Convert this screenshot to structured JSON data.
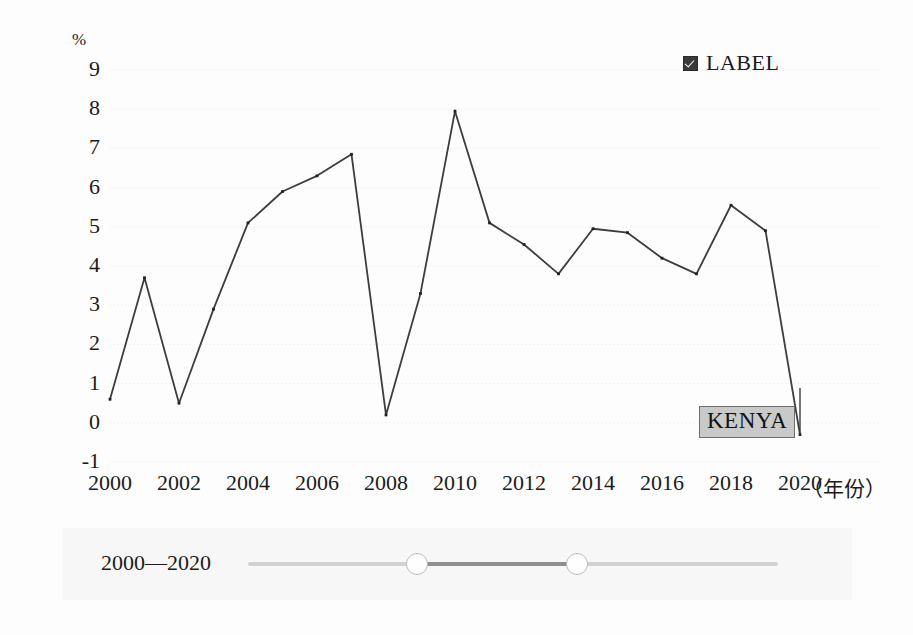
{
  "chart_data": {
    "type": "line",
    "title": "",
    "subtitle": "",
    "xlabel": "（年份）",
    "ylabel": "%",
    "unit_label": "%",
    "x": [
      2000,
      2001,
      2002,
      2003,
      2004,
      2005,
      2006,
      2007,
      2008,
      2009,
      2010,
      2011,
      2012,
      2013,
      2014,
      2015,
      2016,
      2017,
      2018,
      2019,
      2020
    ],
    "series": [
      {
        "name": "KENYA",
        "values": [
          0.6,
          3.7,
          0.5,
          2.9,
          5.1,
          5.9,
          6.3,
          6.85,
          0.2,
          3.3,
          7.95,
          5.1,
          4.55,
          3.8,
          4.95,
          4.85,
          4.2,
          3.8,
          5.55,
          4.9,
          -0.3
        ],
        "color": "#3d3d3d"
      }
    ],
    "xticks": [
      2000,
      2002,
      2004,
      2006,
      2008,
      2010,
      2012,
      2014,
      2016,
      2018,
      2020
    ],
    "xtick_labels": [
      "2000",
      "2002",
      "2004",
      "2006",
      "2008",
      "2010",
      "2012",
      "2014",
      "2016",
      "2018",
      "2020"
    ],
    "yticks": [
      9,
      8,
      7,
      6,
      5,
      4,
      3,
      2,
      1,
      0,
      -1
    ],
    "ytick_labels": [
      "9",
      "8",
      "7",
      "6",
      "5",
      "4",
      "3",
      "2",
      "1",
      "0",
      "-1"
    ],
    "xlim": [
      2000,
      2020
    ],
    "ylim": [
      -1,
      9
    ],
    "grid": true,
    "grid_style": "dotted",
    "legend_position": "top-right"
  },
  "legend": {
    "checkbox_checked": true,
    "label": "LABEL"
  },
  "annotation": {
    "label": "KENYA",
    "attached_year": 2020
  },
  "range_slider": {
    "range_text": "2000—2020",
    "start_value": "2000",
    "end_value": "2020"
  },
  "colors": {
    "line": "#3d3d3d",
    "grid": "#e8e8e8",
    "annotation_background": "#c9c9c9",
    "annotation_border": "#6e6e6e",
    "slider_track": "#d2d2d2",
    "slider_selected": "#8f8f8f",
    "text": "#1b1b1b"
  }
}
